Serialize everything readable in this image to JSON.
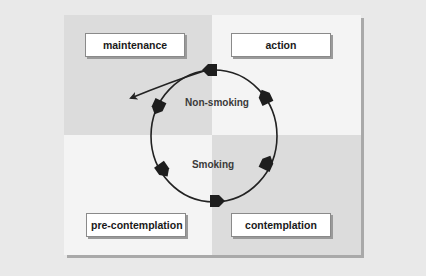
{
  "diagram": {
    "type": "cycle",
    "title": "",
    "colors": {
      "page_background": "#e9e9e9",
      "panel_shadow": "#a9a9a9",
      "quadrant_top_left": "#dcdcdc",
      "quadrant_top_right": "#f4f4f4",
      "quadrant_bottom_left": "#f4f4f4",
      "quadrant_bottom_right": "#dcdcdc",
      "box_fill": "#ffffff",
      "arrow": "#222222"
    },
    "stages": [
      {
        "id": "maintenance",
        "label": "maintenance",
        "quadrant": "top-left"
      },
      {
        "id": "action",
        "label": "action",
        "quadrant": "top-right"
      },
      {
        "id": "pre-contemplation",
        "label": "pre-contemplation",
        "quadrant": "bottom-left"
      },
      {
        "id": "contemplation",
        "label": "contemplation",
        "quadrant": "bottom-right"
      }
    ],
    "center_labels": {
      "top": "Non-smoking",
      "bottom": "Smoking"
    },
    "cycle": {
      "direction": "counter-clockwise",
      "arrowheads": 6,
      "exit_arrow": "from top of cycle toward maintenance quadrant (exit)"
    }
  }
}
